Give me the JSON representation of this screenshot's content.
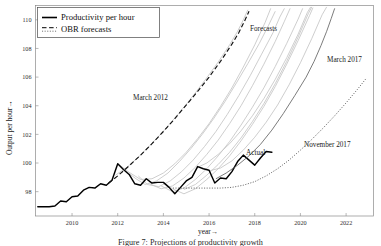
{
  "figure": {
    "caption": "Figure 7: Projections of productivity growth"
  },
  "legend": {
    "position": "top-left",
    "items": [
      {
        "label": "Productivity per hour",
        "style": "solid",
        "color": "#000000"
      },
      {
        "label": "OBR forecasts",
        "style": "dashed-dotted",
        "color": "#555555"
      }
    ]
  },
  "annotations": [
    {
      "name": "march-2012-label",
      "text": "March 2012",
      "x": 133,
      "y": 100
    },
    {
      "name": "forecasts-label",
      "text": "Forecasts",
      "x": 250,
      "y": 31
    },
    {
      "name": "march-2017-label",
      "text": "March 2017",
      "x": 327,
      "y": 62
    },
    {
      "name": "november-2017-label",
      "text": "November 2017",
      "x": 304,
      "y": 147
    },
    {
      "name": "actual-label",
      "text": "Actual",
      "x": 246,
      "y": 155
    }
  ],
  "chart_data": {
    "type": "line",
    "title": "",
    "xlabel": "year→",
    "ylabel": "Output per hour→",
    "xlim": [
      2008.4,
      2023.2
    ],
    "ylim": [
      96.3,
      111.0
    ],
    "xticks": [
      2010,
      2012,
      2014,
      2016,
      2018,
      2020,
      2022
    ],
    "xtick_labels": [
      "2010",
      "2012",
      "2014",
      "2016",
      "2018",
      "2020",
      "2022"
    ],
    "yticks": [
      98,
      100,
      102,
      104,
      106,
      108,
      110
    ],
    "ytick_labels": [
      "98",
      "100",
      "102",
      "104",
      "106",
      "108",
      "110"
    ],
    "grid": false,
    "series": [
      {
        "name": "Productivity per hour",
        "style": "solid",
        "color": "#000000",
        "points": [
          [
            2008.5,
            96.95
          ],
          [
            2008.75,
            96.95
          ],
          [
            2009.0,
            96.95
          ],
          [
            2009.25,
            97.0
          ],
          [
            2009.5,
            97.35
          ],
          [
            2009.75,
            97.3
          ],
          [
            2010.0,
            97.65
          ],
          [
            2010.25,
            97.7
          ],
          [
            2010.5,
            98.1
          ],
          [
            2010.75,
            98.3
          ],
          [
            2011.0,
            98.25
          ],
          [
            2011.25,
            98.55
          ],
          [
            2011.5,
            98.45
          ],
          [
            2011.75,
            98.8
          ],
          [
            2012.0,
            99.95
          ],
          [
            2012.25,
            99.55
          ],
          [
            2012.5,
            99.2
          ],
          [
            2012.75,
            98.55
          ],
          [
            2013.0,
            98.45
          ],
          [
            2013.25,
            98.9
          ],
          [
            2013.5,
            98.6
          ],
          [
            2013.75,
            98.65
          ],
          [
            2014.0,
            98.65
          ],
          [
            2014.25,
            98.3
          ],
          [
            2014.5,
            97.85
          ],
          [
            2014.75,
            98.3
          ],
          [
            2015.0,
            98.75
          ],
          [
            2015.25,
            99.0
          ],
          [
            2015.5,
            99.75
          ],
          [
            2015.75,
            99.6
          ],
          [
            2016.0,
            99.5
          ],
          [
            2016.25,
            98.6
          ],
          [
            2016.5,
            98.95
          ],
          [
            2016.75,
            98.9
          ],
          [
            2017.0,
            99.4
          ],
          [
            2017.25,
            100.1
          ],
          [
            2017.5,
            100.55
          ],
          [
            2017.75,
            100.2
          ],
          [
            2018.0,
            99.85
          ],
          [
            2018.25,
            100.35
          ],
          [
            2018.5,
            100.8
          ],
          [
            2018.75,
            100.75
          ]
        ]
      },
      {
        "name": "March 2012",
        "style": "dashed",
        "color": "#111111",
        "points": [
          [
            2011.6,
            98.6
          ],
          [
            2012.0,
            99.1
          ],
          [
            2012.5,
            99.8
          ],
          [
            2013.0,
            100.55
          ],
          [
            2013.5,
            101.35
          ],
          [
            2014.0,
            102.2
          ],
          [
            2014.5,
            103.1
          ],
          [
            2015.0,
            104.05
          ],
          [
            2015.5,
            105.0
          ],
          [
            2016.0,
            106.0
          ],
          [
            2016.5,
            107.1
          ],
          [
            2017.0,
            108.3
          ],
          [
            2017.3,
            109.1
          ],
          [
            2017.55,
            109.9
          ],
          [
            2017.75,
            110.6
          ]
        ]
      },
      {
        "name": "March 2017",
        "style": "solid-thin",
        "color": "#5a5a5a",
        "points": [
          [
            2016.3,
            98.9
          ],
          [
            2016.75,
            99.3
          ],
          [
            2017.25,
            99.85
          ],
          [
            2017.75,
            100.5
          ],
          [
            2018.25,
            101.3
          ],
          [
            2018.75,
            102.3
          ],
          [
            2019.25,
            103.45
          ],
          [
            2019.75,
            104.7
          ],
          [
            2020.25,
            106.0
          ],
          [
            2020.6,
            107.1
          ],
          [
            2020.9,
            108.2
          ],
          [
            2021.15,
            109.2
          ],
          [
            2021.35,
            110.1
          ],
          [
            2021.5,
            110.8
          ]
        ]
      },
      {
        "name": "November 2017",
        "style": "dotted",
        "color": "#3a3a3a",
        "points": [
          [
            2014.3,
            98.25
          ],
          [
            2015.0,
            98.25
          ],
          [
            2015.5,
            98.25
          ],
          [
            2016.0,
            98.25
          ],
          [
            2016.5,
            98.25
          ],
          [
            2017.0,
            98.3
          ],
          [
            2017.5,
            98.45
          ],
          [
            2018.0,
            98.7
          ],
          [
            2018.5,
            99.1
          ],
          [
            2019.0,
            99.6
          ],
          [
            2019.5,
            100.2
          ],
          [
            2020.0,
            100.9
          ],
          [
            2020.5,
            101.65
          ],
          [
            2021.0,
            102.45
          ],
          [
            2021.5,
            103.3
          ],
          [
            2022.0,
            104.2
          ],
          [
            2022.5,
            105.15
          ],
          [
            2022.9,
            105.95
          ]
        ]
      },
      {
        "name": "OBR forecast vintage A",
        "style": "solid-grey",
        "color": "#c2c2c2",
        "points": [
          [
            2011.9,
            99.15
          ],
          [
            2012.4,
            99.7
          ],
          [
            2012.9,
            100.4
          ],
          [
            2013.4,
            101.2
          ],
          [
            2013.9,
            102.05
          ],
          [
            2014.4,
            102.95
          ],
          [
            2014.9,
            103.9
          ],
          [
            2015.4,
            104.9
          ],
          [
            2015.9,
            105.95
          ],
          [
            2016.4,
            107.05
          ],
          [
            2016.9,
            108.25
          ],
          [
            2017.25,
            109.2
          ],
          [
            2017.5,
            110.0
          ],
          [
            2017.7,
            110.7
          ]
        ]
      },
      {
        "name": "OBR forecast vintage B",
        "style": "solid-grey",
        "color": "#c2c2c2",
        "points": [
          [
            2012.3,
            99.5
          ],
          [
            2012.8,
            98.9
          ],
          [
            2013.2,
            98.5
          ],
          [
            2013.7,
            98.75
          ],
          [
            2014.2,
            99.3
          ],
          [
            2014.7,
            100.1
          ],
          [
            2015.2,
            101.0
          ],
          [
            2015.7,
            102.0
          ],
          [
            2016.2,
            103.1
          ],
          [
            2016.7,
            104.3
          ],
          [
            2017.2,
            105.6
          ],
          [
            2017.7,
            106.95
          ],
          [
            2018.2,
            108.35
          ],
          [
            2018.6,
            109.6
          ],
          [
            2018.9,
            110.6
          ]
        ]
      },
      {
        "name": "OBR forecast vintage C",
        "style": "solid-grey",
        "color": "#c2c2c2",
        "points": [
          [
            2012.9,
            99.1
          ],
          [
            2013.3,
            98.5
          ],
          [
            2013.8,
            98.35
          ],
          [
            2014.3,
            98.75
          ],
          [
            2014.8,
            99.4
          ],
          [
            2015.3,
            100.2
          ],
          [
            2015.8,
            101.15
          ],
          [
            2016.3,
            102.2
          ],
          [
            2016.8,
            103.4
          ],
          [
            2017.3,
            104.7
          ],
          [
            2017.8,
            106.1
          ],
          [
            2018.3,
            107.6
          ],
          [
            2018.8,
            109.1
          ],
          [
            2019.1,
            110.2
          ],
          [
            2019.3,
            110.8
          ]
        ]
      },
      {
        "name": "OBR forecast vintage D",
        "style": "solid-grey",
        "color": "#c2c2c2",
        "points": [
          [
            2013.4,
            98.55
          ],
          [
            2013.9,
            98.2
          ],
          [
            2014.4,
            98.4
          ],
          [
            2014.9,
            98.95
          ],
          [
            2015.4,
            99.7
          ],
          [
            2015.9,
            100.6
          ],
          [
            2016.4,
            101.6
          ],
          [
            2016.9,
            102.75
          ],
          [
            2017.4,
            104.0
          ],
          [
            2017.9,
            105.4
          ],
          [
            2018.4,
            106.9
          ],
          [
            2018.9,
            108.5
          ],
          [
            2019.3,
            109.9
          ],
          [
            2019.55,
            110.8
          ]
        ]
      },
      {
        "name": "OBR forecast vintage E",
        "style": "solid-grey",
        "color": "#c2c2c2",
        "points": [
          [
            2013.9,
            98.4
          ],
          [
            2014.4,
            98.0
          ],
          [
            2014.9,
            98.25
          ],
          [
            2015.4,
            98.85
          ],
          [
            2015.9,
            99.6
          ],
          [
            2016.4,
            100.5
          ],
          [
            2016.9,
            101.5
          ],
          [
            2017.4,
            102.65
          ],
          [
            2017.9,
            103.9
          ],
          [
            2018.4,
            105.25
          ],
          [
            2018.9,
            106.75
          ],
          [
            2019.4,
            108.35
          ],
          [
            2019.9,
            110.05
          ],
          [
            2020.1,
            110.8
          ]
        ]
      },
      {
        "name": "OBR forecast vintage F",
        "style": "solid-grey",
        "color": "#c2c2c2",
        "points": [
          [
            2014.4,
            98.2
          ],
          [
            2014.9,
            97.85
          ],
          [
            2015.4,
            98.2
          ],
          [
            2015.9,
            98.85
          ],
          [
            2016.4,
            99.6
          ],
          [
            2016.9,
            100.5
          ],
          [
            2017.4,
            101.55
          ],
          [
            2017.9,
            102.7
          ],
          [
            2018.4,
            103.95
          ],
          [
            2018.9,
            105.35
          ],
          [
            2019.4,
            106.9
          ],
          [
            2019.9,
            108.55
          ],
          [
            2020.4,
            110.3
          ],
          [
            2020.55,
            110.85
          ]
        ]
      },
      {
        "name": "OBR forecast vintage G",
        "style": "solid-grey",
        "color": "#c2c2c2",
        "points": [
          [
            2014.9,
            98.15
          ],
          [
            2015.4,
            98.5
          ],
          [
            2015.9,
            99.15
          ],
          [
            2016.4,
            99.9
          ],
          [
            2016.9,
            100.75
          ],
          [
            2017.4,
            101.75
          ],
          [
            2017.9,
            102.9
          ],
          [
            2018.4,
            104.15
          ],
          [
            2018.9,
            105.55
          ],
          [
            2019.4,
            107.1
          ],
          [
            2019.9,
            108.8
          ],
          [
            2020.35,
            110.45
          ],
          [
            2020.5,
            110.9
          ]
        ]
      },
      {
        "name": "OBR forecast vintage H",
        "style": "solid-grey",
        "color": "#c2c2c2",
        "points": [
          [
            2015.5,
            99.7
          ],
          [
            2015.9,
            100.0
          ],
          [
            2016.4,
            100.6
          ],
          [
            2016.9,
            101.35
          ],
          [
            2017.4,
            102.25
          ],
          [
            2017.9,
            103.3
          ],
          [
            2018.4,
            104.5
          ],
          [
            2018.9,
            105.85
          ],
          [
            2019.4,
            107.35
          ],
          [
            2019.9,
            109.0
          ],
          [
            2020.3,
            110.5
          ],
          [
            2020.45,
            110.9
          ]
        ]
      },
      {
        "name": "OBR forecast vintage I",
        "style": "solid-grey",
        "color": "#c2c2c2",
        "points": [
          [
            2016.0,
            99.45
          ],
          [
            2016.5,
            99.65
          ],
          [
            2017.0,
            100.15
          ],
          [
            2017.5,
            100.9
          ],
          [
            2018.0,
            101.8
          ],
          [
            2018.5,
            102.85
          ],
          [
            2019.0,
            104.05
          ],
          [
            2019.5,
            105.45
          ],
          [
            2020.0,
            107.0
          ],
          [
            2020.5,
            108.7
          ],
          [
            2020.95,
            110.35
          ],
          [
            2021.15,
            110.9
          ]
        ]
      },
      {
        "name": "OBR forecast vintage J",
        "style": "solid-grey",
        "color": "#c2c2c2",
        "points": [
          [
            2012.0,
            99.95
          ],
          [
            2012.5,
            99.35
          ],
          [
            2013.0,
            98.85
          ],
          [
            2013.5,
            98.9
          ],
          [
            2014.0,
            99.3
          ],
          [
            2014.5,
            99.95
          ],
          [
            2015.0,
            100.75
          ],
          [
            2015.5,
            101.7
          ],
          [
            2016.0,
            102.75
          ],
          [
            2016.5,
            103.95
          ],
          [
            2017.0,
            105.25
          ],
          [
            2017.5,
            106.7
          ],
          [
            2018.0,
            108.25
          ],
          [
            2018.45,
            109.8
          ],
          [
            2018.7,
            110.8
          ]
        ]
      }
    ]
  }
}
